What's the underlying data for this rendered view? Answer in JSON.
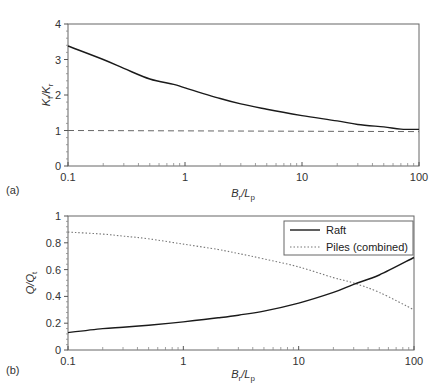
{
  "chart_data": [
    {
      "panel": "(a)",
      "type": "line",
      "title": "",
      "xlabel": "B_r/L_p",
      "ylabel": "K_f/K_r",
      "xscale": "log",
      "xlim": [
        0.1,
        100
      ],
      "ylim": [
        0,
        4
      ],
      "xticks": [
        "0.1",
        "1",
        "10",
        "100"
      ],
      "yticks": [
        "0",
        "1",
        "2",
        "3",
        "4"
      ],
      "grid": false,
      "series": [
        {
          "name": "K_f/K_r",
          "style": "solid",
          "x": [
            0.1,
            0.2,
            0.3,
            0.5,
            0.8,
            1,
            2,
            3,
            5,
            10,
            20,
            30,
            50,
            70,
            100
          ],
          "y": [
            3.38,
            3.0,
            2.75,
            2.45,
            2.3,
            2.2,
            1.9,
            1.75,
            1.6,
            1.42,
            1.27,
            1.17,
            1.1,
            1.04,
            1.03
          ]
        },
        {
          "name": "reference line",
          "style": "dashed",
          "x": [
            0.1,
            100
          ],
          "y": [
            1.0,
            0.97
          ]
        }
      ]
    },
    {
      "panel": "(b)",
      "type": "line",
      "title": "",
      "xlabel": "B_r/L_p",
      "ylabel": "Q/Q_t",
      "xscale": "log",
      "xlim": [
        0.1,
        100
      ],
      "ylim": [
        0,
        1
      ],
      "xticks": [
        "0.1",
        "1",
        "10",
        "100"
      ],
      "yticks": [
        "0",
        "0.2",
        "0.4",
        "0.6",
        "0.8",
        "1"
      ],
      "grid": false,
      "legend_position": "upper right",
      "series": [
        {
          "name": "Raft",
          "style": "solid",
          "x": [
            0.1,
            0.2,
            0.3,
            0.5,
            1,
            2,
            3,
            5,
            10,
            20,
            30,
            50,
            100
          ],
          "y": [
            0.13,
            0.16,
            0.17,
            0.185,
            0.21,
            0.24,
            0.26,
            0.29,
            0.35,
            0.43,
            0.49,
            0.56,
            0.69
          ]
        },
        {
          "name": "Piles (combined)",
          "style": "dotted",
          "x": [
            0.1,
            0.2,
            0.3,
            0.5,
            1,
            2,
            3,
            5,
            10,
            20,
            30,
            50,
            100
          ],
          "y": [
            0.88,
            0.865,
            0.85,
            0.83,
            0.79,
            0.75,
            0.72,
            0.68,
            0.62,
            0.54,
            0.5,
            0.43,
            0.3
          ]
        }
      ]
    }
  ],
  "panels": {
    "a": {
      "label": "(a)",
      "ylabel_main": "K",
      "ylabel_sub1": "f",
      "ylabel_mid": "/K",
      "ylabel_sub2": "r",
      "xlabel_main": "B",
      "xlabel_sub1": "r",
      "xlabel_mid": "/L",
      "xlabel_sub2": "p"
    },
    "b": {
      "label": "(b)",
      "ylabel_main": "Q/Q",
      "ylabel_sub": "t",
      "xlabel_main": "B",
      "xlabel_sub1": "r",
      "xlabel_mid": "/L",
      "xlabel_sub2": "p",
      "legend": [
        {
          "label": "Raft",
          "style": "solid"
        },
        {
          "label": "Piles (combined)",
          "style": "dotted"
        }
      ]
    }
  },
  "colors": {
    "line": "#1a1a1a",
    "axis": "#555555",
    "dashed": "#666666",
    "dotted": "#777777"
  }
}
